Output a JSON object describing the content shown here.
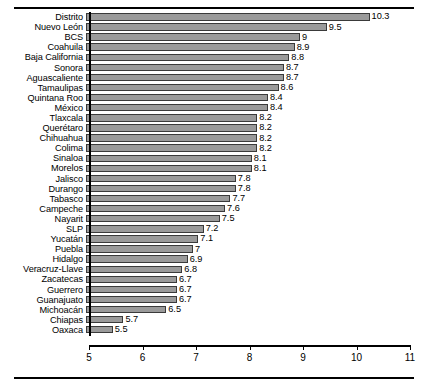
{
  "figure": {
    "clipped_caption": "",
    "rules": {
      "top": true,
      "bottom": true
    }
  },
  "chart_data": {
    "type": "bar",
    "orientation": "horizontal",
    "title": "",
    "subtitle": "",
    "xlabel": "",
    "ylabel": "",
    "xlim": [
      5,
      11
    ],
    "ylim": null,
    "grid": false,
    "legend": null,
    "xticks": [
      5,
      6,
      7,
      8,
      9,
      10,
      11
    ],
    "xticklabels": [
      "5",
      "6",
      "7",
      "8",
      "9",
      "10",
      "11"
    ],
    "bar_color": "#9a9a9a",
    "bar_edge_color": "#3a3a3a",
    "value_label_format": "trim-trailing-zero",
    "categories": [
      "Distrito",
      "Nuevo León",
      "BCS",
      "Coahuila",
      "Baja California",
      "Sonora",
      "Aguascaliente",
      "Tamaulipas",
      "Quintana Roo",
      "México",
      "Tlaxcala",
      "Querétaro",
      "Chihuahua",
      "Colima",
      "Sinaloa",
      "Morelos",
      "Jalisco",
      "Durango",
      "Tabasco",
      "Campeche",
      "Nayarit",
      "SLP",
      "Yucatán",
      "Puebla",
      "Hidalgo",
      "Veracruz-Llave",
      "Zacatecas",
      "Guerrero",
      "Guanajuato",
      "Michoacán",
      "Chiapas",
      "Oaxaca"
    ],
    "values": [
      10.3,
      9.5,
      9,
      8.9,
      8.8,
      8.7,
      8.7,
      8.6,
      8.4,
      8.4,
      8.2,
      8.2,
      8.2,
      8.2,
      8.1,
      8.1,
      7.8,
      7.8,
      7.7,
      7.6,
      7.5,
      7.2,
      7.1,
      7,
      6.9,
      6.8,
      6.7,
      6.7,
      6.7,
      6.5,
      5.7,
      5.5
    ],
    "value_labels": [
      "10.3",
      "9.5",
      "9",
      "8.9",
      "8.8",
      "8.7",
      "8.7",
      "8.6",
      "8.4",
      "8.4",
      "8.2",
      "8.2",
      "8.2",
      "8.2",
      "8.1",
      "8.1",
      "7.8",
      "7.8",
      "7.7",
      "7.6",
      "7.5",
      "7.2",
      "7.1",
      "7",
      "6.9",
      "6.8",
      "6.7",
      "6.7",
      "6.7",
      "6.5",
      "5.7",
      "5.5"
    ]
  }
}
